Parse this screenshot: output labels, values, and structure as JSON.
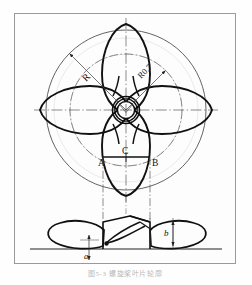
{
  "figure": {
    "caption": "图5-3  螺旋桨叶片轮廓",
    "type": "engineering-drawing",
    "views": [
      {
        "name": "plan-view",
        "description": "Four-bladed propeller projected outline with hub"
      },
      {
        "name": "elevation-view",
        "description": "Side elevation showing blade pitch section"
      }
    ]
  },
  "labels": {
    "radius_full": "R",
    "radius_seven_tenths": "R0.7",
    "point_a": "A",
    "point_b": "B",
    "point_c": "C",
    "dim_a": "a",
    "dim_b": "b"
  },
  "colors": {
    "ink": "#111111",
    "thin": "#4a4a4a",
    "center_line": "#5a5a5a",
    "frame": "#9a9a9a",
    "paper": "#fdfdfd",
    "caption": "#b9b9b9"
  },
  "geometry": {
    "hub_center": {
      "x": 126,
      "y": 110
    },
    "outer_circle_radius": 80,
    "seven_tenths_circle_radius": 56,
    "hub_outer_radius": 13,
    "hub_inner_radius": 9,
    "blade_count": 4,
    "baseline_y": 249
  }
}
